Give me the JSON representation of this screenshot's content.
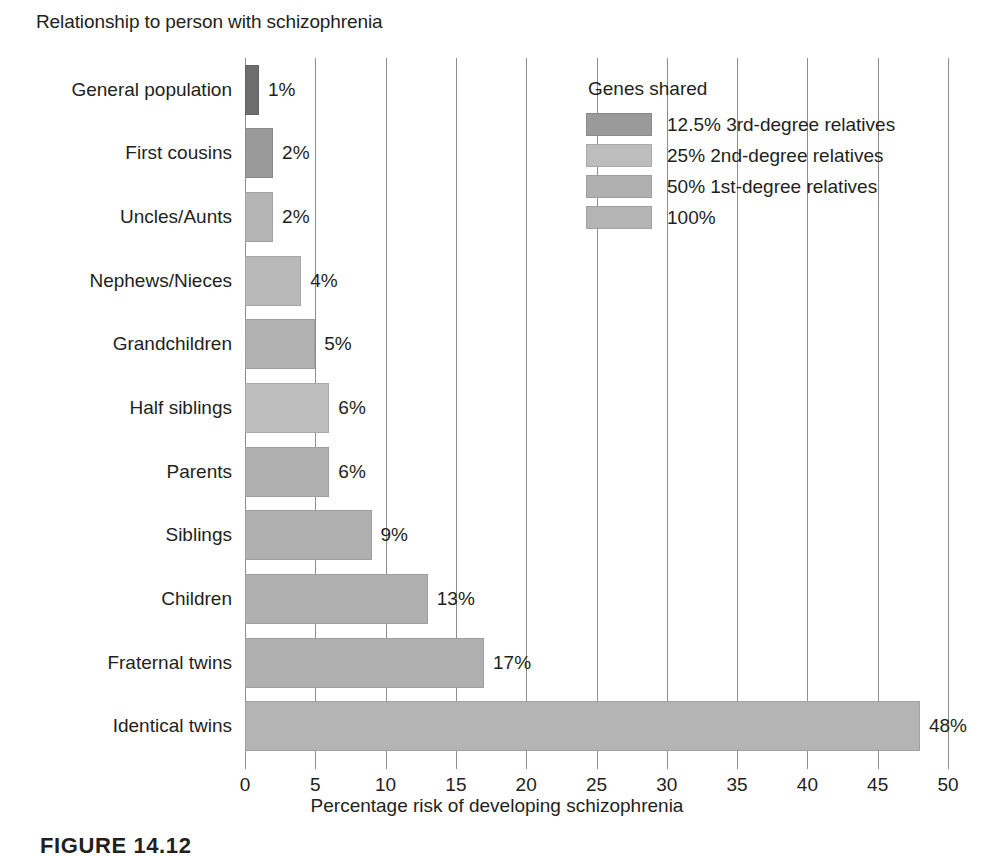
{
  "chart_data": {
    "type": "bar",
    "orientation": "horizontal",
    "title": "",
    "ylabel": "Relationship to person with schizophrenia",
    "xlabel": "Percentage risk of developing schizophrenia",
    "xlim": [
      0,
      50
    ],
    "xticks": [
      "0",
      "5",
      "10",
      "15",
      "20",
      "25",
      "30",
      "35",
      "40",
      "45",
      "50"
    ],
    "grid": "vertical",
    "legend_position": "top-right",
    "categories": [
      "General population",
      "First cousins",
      "Uncles/Aunts",
      "Nephews/Nieces",
      "Grandchildren",
      "Half siblings",
      "Parents",
      "Siblings",
      "Children",
      "Fraternal twins",
      "Identical twins"
    ],
    "values": [
      1,
      2,
      2,
      4,
      5,
      6,
      6,
      9,
      13,
      17,
      48
    ],
    "value_labels": [
      "1%",
      "2%",
      "2%",
      "4%",
      "5%",
      "6%",
      "6%",
      "9%",
      "13%",
      "17%",
      "48%"
    ],
    "group_of_each_bar": [
      "general",
      "third_degree",
      "third_degree",
      "second_degree",
      "second_degree",
      "second_degree",
      "first_degree",
      "first_degree",
      "first_degree",
      "first_degree",
      "identical"
    ],
    "bar_colors": [
      "#6e6e6e",
      "#9a9a9a",
      "#b4b4b4",
      "#b9b9b9",
      "#b2b2b2",
      "#bdbdbd",
      "#b0b0b0",
      "#b0b0b0",
      "#b0b0b0",
      "#b0b0b0",
      "#b4b4b4"
    ],
    "legend": {
      "title": "Genes shared",
      "entries": [
        {
          "label": "12.5% 3rd-degree relatives",
          "color": "#9a9a9a"
        },
        {
          "label": "25% 2nd-degree relatives",
          "color": "#bdbdbd"
        },
        {
          "label": "50% 1st-degree relatives",
          "color": "#b0b0b0"
        },
        {
          "label": "100%",
          "color": "#b4b4b4"
        }
      ]
    }
  },
  "figure": {
    "caption": "FIGURE 14.12"
  },
  "colors": {
    "axis": "#8d8d8d",
    "text": "#231f20",
    "background": "#ffffff"
  }
}
